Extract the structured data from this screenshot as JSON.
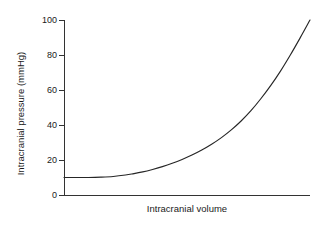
{
  "chart_data": {
    "type": "line",
    "title": "",
    "subtitle": "",
    "xlabel": "Intracranial volume",
    "ylabel": "Intracranial pressure (mmHg)",
    "ylim": [
      0,
      100
    ],
    "xlim": [
      0,
      100
    ],
    "yticks": [
      0,
      20,
      40,
      60,
      80,
      100
    ],
    "ytick_labels": [
      "0",
      "20",
      "40",
      "60",
      "80",
      "100"
    ],
    "xticks": [],
    "xtick_labels": [],
    "grid": false,
    "legend": null,
    "annotations": [],
    "series": [
      {
        "name": "Intracranial pressure",
        "color": "#262626",
        "x": [
          0,
          5,
          10,
          15,
          20,
          25,
          28,
          32,
          36,
          40,
          44,
          48,
          52,
          56,
          60,
          64,
          68,
          72,
          76,
          80,
          84,
          88,
          92,
          96,
          100
        ],
        "values": [
          10,
          10,
          10,
          10.2,
          10.6,
          11.4,
          12.1,
          13.2,
          14.6,
          16.2,
          18.1,
          20.3,
          22.8,
          25.7,
          29.0,
          32.8,
          37.2,
          42.3,
          48.2,
          55.0,
          62.5,
          70.8,
          80.0,
          89.8,
          100
        ]
      }
    ]
  },
  "axis": {
    "y_tick_marks": "tick",
    "x_tick_marks": "none",
    "spine_color": "#333333",
    "curve_color": "#262626",
    "background": "#ffffff"
  },
  "geometry": {
    "plot_left": 64,
    "plot_right": 310,
    "plot_top": 20,
    "plot_bottom": 195
  }
}
